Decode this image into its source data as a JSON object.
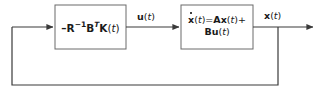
{
  "diagram": {
    "type": "control-block-diagram",
    "width": 322,
    "height": 94,
    "background_color": "#ffffff",
    "line_color": "#3a3a3a",
    "text_color": "#1a1a1a"
  },
  "blocks": [
    {
      "id": "controller",
      "name": "gain-block",
      "label": "-R^-1 B^T K(t)",
      "parts": {
        "minus": "–",
        "R": "R",
        "R_exp": "−1",
        "B": "B",
        "B_exp": "T",
        "K": "K",
        "open_paren": "(",
        "t": "t",
        "close_paren": ")"
      },
      "x": 55,
      "y": 5,
      "width": 71,
      "height": 44
    },
    {
      "id": "plant",
      "name": "plant-block",
      "label": "ẋ(t) = Ax(t) + Bu(t)",
      "line1": {
        "xdot": "x",
        "open_paren": "(",
        "t": "t",
        "close_paren": ")",
        "equals": "=",
        "A": "A",
        "x": "x",
        "plus": "+"
      },
      "line2": {
        "B": "B",
        "u": "u",
        "open_paren": "(",
        "t": "t",
        "close_paren": ")"
      },
      "x": 181,
      "y": 5,
      "width": 72,
      "height": 44
    }
  ],
  "signals": [
    {
      "id": "u",
      "name": "control-signal-label",
      "symbol": "u",
      "arg_open": "(",
      "arg": "t",
      "arg_close": ")",
      "label": "u(t)",
      "x": 137,
      "y": 11
    },
    {
      "id": "x",
      "name": "state-signal-label",
      "symbol": "x",
      "arg_open": "(",
      "arg": "t",
      "arg_close": ")",
      "label": "x(t)",
      "x": 264,
      "y": 10
    }
  ],
  "connections": [
    {
      "id": "feedback-to-controller",
      "name": "feedback-input-arrow",
      "from": [
        12,
        27
      ],
      "to": [
        55,
        27
      ],
      "arrowhead": true
    },
    {
      "id": "controller-to-plant",
      "name": "control-signal-arrow",
      "from": [
        126,
        27
      ],
      "to": [
        181,
        27
      ],
      "arrowhead": true
    },
    {
      "id": "plant-to-output",
      "name": "state-output-arrow",
      "from": [
        253,
        27
      ],
      "to": [
        315,
        27
      ],
      "arrowhead": true
    },
    {
      "id": "feedback-tap",
      "name": "feedback-tap-line",
      "from": [
        278,
        27
      ],
      "to": [
        278,
        85
      ],
      "arrowhead": false
    },
    {
      "id": "feedback-bottom",
      "name": "feedback-return-line",
      "from": [
        278,
        85
      ],
      "to": [
        12,
        85
      ],
      "arrowhead": false
    },
    {
      "id": "feedback-left",
      "name": "feedback-riser-line",
      "from": [
        12,
        85
      ],
      "to": [
        12,
        27
      ],
      "arrowhead": false
    }
  ]
}
